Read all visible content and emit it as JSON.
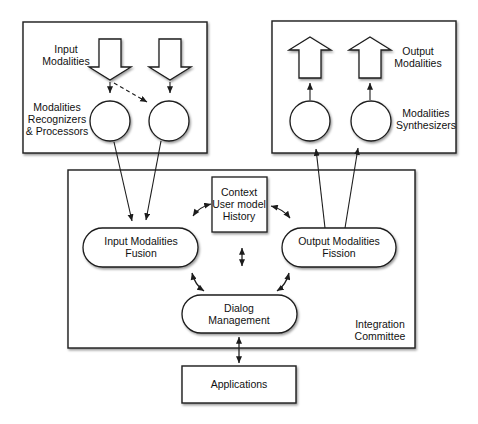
{
  "colors": {
    "stroke": "#1c1c1c",
    "node_fill": "#ffffff",
    "background": "#ffffff"
  },
  "input_box": {
    "modalities_label": "Input\nModalities",
    "recognizers_label": "Modalities\nRecognizers\n& Processors"
  },
  "output_box": {
    "modalities_label": "Output\nModalities",
    "synthesizers_label": "Modalities\nSynthesizers"
  },
  "integration_committee": {
    "label": "Integration\nCommittee",
    "context_node_label": "Context\nUser model\nHistory",
    "input_fusion_label": "Input Modalities\nFusion",
    "output_fission_label": "Output Modalities\nFission",
    "dialog_management_label": "Dialog\nManagement"
  },
  "applications_label": "Applications"
}
